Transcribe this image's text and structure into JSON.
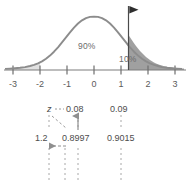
{
  "figure": {
    "curve": {
      "type": "normal-density",
      "axis_label": "z",
      "axis_ticks": [
        -3,
        -2,
        -1,
        0,
        1,
        2,
        3
      ],
      "axis_tick_labels": [
        "-3",
        "-2",
        "-1",
        "0",
        "1",
        "2",
        "3"
      ],
      "xlim": [
        -3.3,
        3.3
      ],
      "area_left_label": "90%",
      "area_right_label": "10%",
      "cut_point_z": 1.28,
      "marker": "flag",
      "curve_color": "#8c8c8c",
      "shade_color": "#8f8f8f",
      "axis_color": "#6e6e6e",
      "text_color": "#6b6b6b"
    }
  },
  "ztable": {
    "columns": [
      "z",
      "0.08",
      "0.09"
    ],
    "row_label": "1.2",
    "values": [
      "0.8997",
      "0.9015"
    ],
    "arrows": [
      {
        "name": "up-arrow-to-column-header",
        "from": "0.8997",
        "to": "0.08"
      },
      {
        "name": "left-arrow-to-row-label",
        "from": "0.8997",
        "to": "1.2"
      },
      {
        "name": "diagonal-dashed-guide",
        "from": "z",
        "to": "0.8997"
      }
    ],
    "dashed_color": "#9a9a9a",
    "text_color": "#4d4d4d"
  },
  "colors": {
    "background": "#ffffff",
    "ink": "#4d4d4d",
    "muted": "#8c8c8c"
  }
}
